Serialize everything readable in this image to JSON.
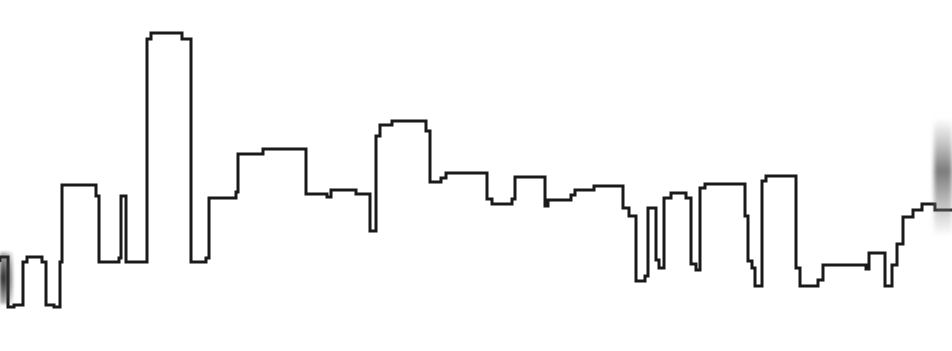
{
  "image": {
    "title": "City Skyline Outline",
    "subject": "city-skyline-silhouette",
    "description": "Black line-drawing outline of a city skyline on a white background",
    "width": 952,
    "height": 351,
    "background_color": "#ffffff",
    "stroke_color": "#1a1a1a",
    "stroke_width": 3,
    "fill": "none"
  },
  "artifacts": {
    "right_edge_smudge": {
      "name": "right-edge-gray-smudge",
      "color": "#5a5a5a",
      "x": 934,
      "y": 118,
      "width": 18,
      "height": 118
    },
    "left_edge_smudge": {
      "name": "left-edge-dark-smudge",
      "color": "#191919",
      "x": 0,
      "y": 252,
      "width": 13,
      "height": 52
    }
  },
  "skyline": {
    "type": "polyline",
    "note": "Stepped rooftop profile traced left to right; coordinates in image pixel space.",
    "baseline_y": 307,
    "points": "0,262 0,257 8,257 8,307 14,307 14,305 23,305 23,262 27,262 27,257 42,257 42,262 46,262 46,305 54,305 54,307 60,307 60,262 62,262 62,185 96,185 96,196 99,196 99,262 119,262 119,258 121,258 121,196 126,196 126,262 147,262 147,39 151,39 151,33 182,33 182,39 191,39 191,262 206,262 206,258 209,258 209,198 236,198 236,192 238,192 238,154 263,154 263,149 306,149 306,194 327,194 327,197 331,197 331,190 356,190 356,194 370,194 370,231 376,231 376,136 380,136 380,125 392,125 392,121 426,121 426,131 430,131 430,182 441,182 441,178 446,178 446,173 487,173 487,199 492,199 492,204 512,204 512,199 515,199 515,177 545,177 545,206 548,206 548,200 571,200 571,195 575,195 575,190 594,190 594,186 623,186 623,208 629,208 629,216 636,216 636,281 645,281 645,276 648,276 648,208 656,208 656,260 659,260 659,268 664,268 664,198 671,198 671,193 686,193 686,198 691,198 691,264 696,264 696,270 700,270 700,188 705,188 705,184 745,184 745,216 748,216 748,261 752,261 752,268 755,268 755,286 762,286 762,181 766,181 766,176 796,176 796,268 800,268 800,286 818,286 818,280 823,280 823,265 866,265 866,269 869,269 869,253 885,253 885,286 892,286 892,265 897,265 897,244 903,244 903,217 913,217 913,210 922,210 922,204 935,204 935,210 952,210"
  }
}
